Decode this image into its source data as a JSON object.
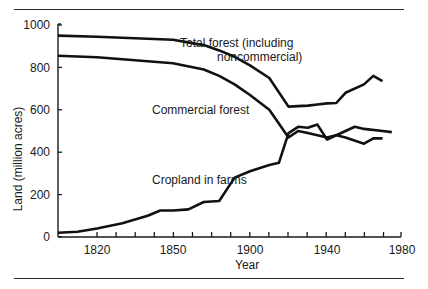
{
  "chart_data": {
    "type": "line",
    "title": "",
    "xlabel": "Year",
    "ylabel": "Land (million acres)",
    "ylim": [
      0,
      1000
    ],
    "xlim": [
      1800,
      1980
    ],
    "grid": false,
    "legend": "inline annotations",
    "yticks": [
      "0",
      "200",
      "400",
      "600",
      "800",
      "1000"
    ],
    "xticks": [
      "1820",
      "1850",
      "1900",
      "1940",
      "1980"
    ],
    "annotations": {
      "total_forest_line1": "Total forest (including",
      "total_forest_line2": "noncommercial)",
      "commercial_forest": "Commercial forest",
      "cropland": "Cropland in farms"
    },
    "series": [
      {
        "name": "Total forest (including noncommercial)",
        "x": [
          1800,
          1820,
          1850,
          1870,
          1880,
          1890,
          1900,
          1910,
          1920,
          1930,
          1935,
          1940,
          1945,
          1950,
          1960,
          1965,
          1970
        ],
        "values": [
          950,
          945,
          930,
          905,
          880,
          850,
          810,
          750,
          615,
          620,
          625,
          630,
          632,
          680,
          720,
          760,
          735
        ]
      },
      {
        "name": "Commercial forest",
        "x": [
          1800,
          1820,
          1850,
          1870,
          1880,
          1890,
          1900,
          1910,
          1920,
          1925,
          1930,
          1940,
          1945,
          1950,
          1955,
          1960,
          1970,
          1975
        ],
        "values": [
          855,
          848,
          820,
          790,
          760,
          720,
          670,
          600,
          470,
          500,
          490,
          470,
          480,
          500,
          520,
          510,
          500,
          495
        ]
      },
      {
        "name": "Cropland in farms",
        "x": [
          1800,
          1810,
          1820,
          1830,
          1840,
          1845,
          1850,
          1860,
          1870,
          1880,
          1890,
          1900,
          1910,
          1915,
          1920,
          1925,
          1930,
          1935,
          1940,
          1945,
          1950,
          1960,
          1965,
          1970
        ],
        "values": [
          20,
          25,
          40,
          65,
          100,
          125,
          125,
          130,
          165,
          170,
          280,
          310,
          340,
          350,
          490,
          520,
          515,
          530,
          460,
          480,
          470,
          440,
          465,
          465
        ]
      }
    ]
  }
}
